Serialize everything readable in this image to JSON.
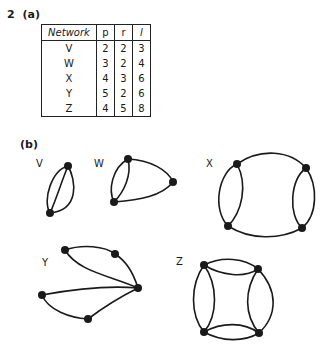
{
  "question": {
    "number": "2",
    "part_a": "(a)",
    "part_b": "(b)"
  },
  "table": {
    "headers": [
      "Network",
      "p",
      "r",
      "l"
    ],
    "rows": [
      [
        "V",
        "2",
        "2",
        "3"
      ],
      [
        "W",
        "3",
        "2",
        "4"
      ],
      [
        "X",
        "4",
        "3",
        "6"
      ],
      [
        "Y",
        "5",
        "2",
        "6"
      ],
      [
        "Z",
        "4",
        "5",
        "8"
      ]
    ]
  },
  "graphs": [
    {
      "label": "V",
      "vertices": 2,
      "edges": 3
    },
    {
      "label": "W",
      "vertices": 3,
      "edges": 4
    },
    {
      "label": "X",
      "vertices": 4,
      "edges": 6
    },
    {
      "label": "Y",
      "vertices": 5,
      "edges": 6
    },
    {
      "label": "Z",
      "vertices": 4,
      "edges": 8
    }
  ]
}
